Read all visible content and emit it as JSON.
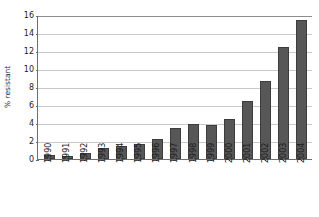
{
  "chart_data": {
    "type": "bar",
    "title": "",
    "subtitle": "",
    "xlabel": "",
    "ylabel": "% resistant",
    "categories": [
      "1990",
      "1991",
      "1992",
      "1993",
      "1994",
      "1995",
      "1996",
      "1997",
      "1998",
      "1999",
      "2000",
      "2001",
      "2002",
      "2003",
      "2004"
    ],
    "values": [
      0.4,
      0.3,
      0.7,
      1.2,
      1.5,
      1.7,
      2.2,
      3.5,
      3.9,
      3.8,
      4.5,
      6.4,
      8.7,
      12.4,
      15.5
    ],
    "ylim": [
      0,
      16
    ],
    "y_ticks": [
      0,
      2,
      4,
      6,
      8,
      10,
      12,
      14,
      16
    ],
    "y_tick_labels": [
      "0",
      "2",
      "4",
      "6",
      "8",
      "10",
      "12",
      "14",
      "16"
    ],
    "grid": true,
    "legend": false,
    "legend_position": "none",
    "bar_color": "#575757",
    "bar_edge_color": "#3d3d3d",
    "grid_color": "#c9c9c9",
    "axis_color": "#6e6e6e",
    "background_color": "#ffffff",
    "text_color": "#1c1c1c"
  }
}
